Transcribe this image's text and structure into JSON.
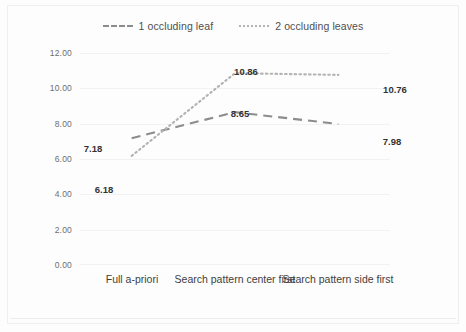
{
  "chart_data": {
    "type": "line",
    "title": "",
    "xlabel": "",
    "ylabel": "Average harvesting time (sec)",
    "categories": [
      "Full a-priori",
      "Search pattern center first",
      "Search pattern side first"
    ],
    "series": [
      {
        "name": "1 occluding leaf",
        "style": "dashed",
        "color": "#8c8c8c",
        "values": [
          7.18,
          8.65,
          7.98
        ],
        "labels": [
          "7.18",
          "8.65",
          "7.98"
        ]
      },
      {
        "name": "2 occluding leaves",
        "style": "dotted",
        "color": "#b4b4b4",
        "values": [
          6.18,
          10.86,
          10.76
        ],
        "labels": [
          "6.18",
          "10.86",
          "10.76"
        ]
      }
    ],
    "ylim": [
      0,
      12
    ],
    "ytick_step": 2,
    "ytick_labels": [
      "0.00",
      "2.00",
      "4.00",
      "6.00",
      "8.00",
      "10.00",
      "12.00"
    ],
    "grid": true,
    "legend_position": "top"
  },
  "legend": {
    "items": [
      {
        "label": "1 occluding leaf",
        "marker": "dashed-line-swatch"
      },
      {
        "label": "2 occluding leaves",
        "marker": "dotted-line-swatch"
      }
    ]
  },
  "axes": {
    "y_title": "Average harvesting time (sec)",
    "y_tick_labels": [
      "12.00",
      "10.00",
      "8.00",
      "6.00",
      "4.00",
      "2.00",
      "0.00"
    ],
    "x_tick_labels": [
      "Full a-priori",
      "Search pattern center first",
      "Search pattern side first"
    ]
  }
}
